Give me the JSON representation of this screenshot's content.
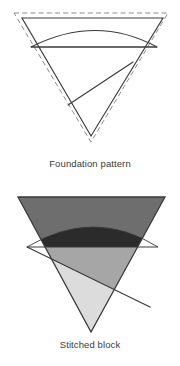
{
  "figures": [
    {
      "id": "foundation",
      "caption": "Foundation pattern",
      "description": "Inverted triangle line drawing with dashed seam allowance outline, an arc, a horizontal chord and a diagonal piecing line",
      "line_color": "#3a3a3a",
      "dashed_color": "#8d8d8d",
      "fill": "#ffffff"
    },
    {
      "id": "stitched",
      "caption": "Stitched block",
      "description": "Inverted triangle filled with four grayscale fabric patches",
      "line_color": "#3a3a3a",
      "patches": [
        {
          "name": "top-band",
          "color": "#6e6e6e"
        },
        {
          "name": "arc-lens",
          "color": "#2b2b2b"
        },
        {
          "name": "middle-wedge",
          "color": "#a6a6a6"
        },
        {
          "name": "bottom-wedge",
          "color": "#dcdcdc"
        }
      ]
    }
  ],
  "colors": {
    "outline": "#3a3a3a",
    "dashed": "#8d8d8d",
    "dark": "#2b2b2b",
    "mid_dark": "#6e6e6e",
    "mid": "#a6a6a6",
    "light": "#dcdcdc",
    "background": "#ffffff",
    "text": "#3b3b3b"
  }
}
